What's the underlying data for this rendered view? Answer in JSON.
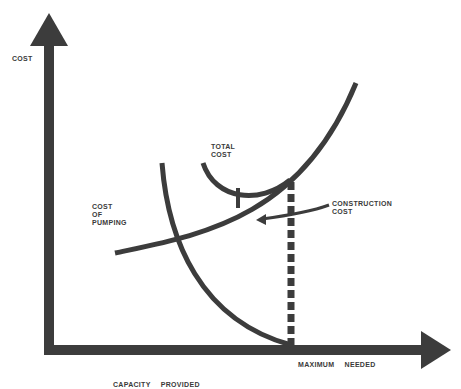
{
  "diagram": {
    "y_axis_label": "COST",
    "x_axis_label": "CAPACITY PROVIDED",
    "x_marker_label": "MAXIMUM NEEDED",
    "curves": [
      {
        "name": "total-cost",
        "label": "TOTAL\nCOST"
      },
      {
        "name": "construction-cost",
        "label": "CONSTRUCTION\nCOST"
      },
      {
        "name": "cost-of-pumping",
        "label": "COST\nOF\nPUMPING"
      }
    ],
    "colors": {
      "ink": "#3c3c3c",
      "background": "#ffffff"
    }
  }
}
